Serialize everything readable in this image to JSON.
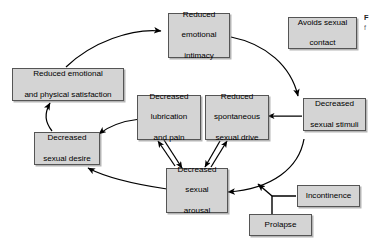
{
  "figure": {
    "type": "cyclical-flow-diagram",
    "title": "",
    "background_color": "#ffffff",
    "node_fill_color": "#d4d4d4",
    "node_border_color": "#555555",
    "arrow_color": "#000000"
  },
  "nodes": [
    {
      "id": "reduced-emotional-intimacy",
      "label": "Reduced emotional intimacy",
      "lines": [
        "Reduced",
        "emotional",
        "intimacy"
      ]
    },
    {
      "id": "avoids-sexual-contact",
      "label": "Avoids sexual contact",
      "lines": [
        "Avoids sexual",
        "contact"
      ]
    },
    {
      "id": "reduced-emotional-and-physical-satisfaction",
      "label": "Reduced emotional and physical satisfaction",
      "lines": [
        "Reduced emotional",
        "and physical satisfaction"
      ]
    },
    {
      "id": "decreased-sexual-stimuli",
      "label": "Decreased sexual stimuli",
      "lines": [
        "Decreased",
        "sexual stimuli"
      ]
    },
    {
      "id": "decreased-lubrication-and-pain",
      "label": "Decreased lubrication and pain",
      "lines": [
        "Decreased",
        "lubrication",
        "and pain"
      ]
    },
    {
      "id": "reduced-spontaneous-sexual-drive",
      "label": "Reduced spontaneous sexual drive",
      "lines": [
        "Reduced",
        "spontaneous",
        "sexual drive"
      ]
    },
    {
      "id": "decreased-sexual-desire",
      "label": "Decreased sexual desire",
      "lines": [
        "Decreased",
        "sexual desire"
      ]
    },
    {
      "id": "decreased-sexual-arousal",
      "label": "Decreased sexual arousal",
      "lines": [
        "Decreased",
        "sexual",
        "arousal"
      ]
    },
    {
      "id": "incontinence",
      "label": "Incontinence",
      "lines": [
        "Incontinence"
      ]
    },
    {
      "id": "prolapse",
      "label": "Prolapse",
      "lines": [
        "Prolapse"
      ]
    }
  ],
  "edges": [
    {
      "from": "reduced-emotional-and-physical-satisfaction",
      "to": "reduced-emotional-intimacy",
      "style": "curved-arrow"
    },
    {
      "from": "reduced-emotional-intimacy",
      "to": "decreased-sexual-stimuli",
      "style": "curved-arrow"
    },
    {
      "from": "decreased-sexual-stimuli",
      "to": "reduced-spontaneous-sexual-drive",
      "style": "straight-arrow"
    },
    {
      "from": "decreased-sexual-stimuli",
      "to": "decreased-sexual-arousal",
      "style": "curved-arrow"
    },
    {
      "from": "decreased-sexual-arousal",
      "to": "decreased-sexual-desire",
      "style": "curved-arrow"
    },
    {
      "from": "decreased-sexual-desire",
      "to": "reduced-emotional-and-physical-satisfaction",
      "style": "curved-arrow"
    },
    {
      "from": "decreased-sexual-arousal",
      "to": "decreased-lubrication-and-pain",
      "style": "straight-arrow"
    },
    {
      "from": "decreased-sexual-arousal",
      "to": "reduced-spontaneous-sexual-drive",
      "style": "straight-arrow"
    },
    {
      "from": "decreased-lubrication-and-pain",
      "to": "decreased-sexual-arousal",
      "style": "straight-arrow"
    },
    {
      "from": "decreased-lubrication-and-pain",
      "to": "decreased-sexual-desire",
      "style": "curved-arrow"
    },
    {
      "from": "incontinence",
      "to": "decreased-sexual-arousal",
      "style": "elbow-arrow"
    },
    {
      "from": "prolapse",
      "to": "decreased-sexual-arousal",
      "style": "elbow-arrow"
    }
  ],
  "caption": {
    "line1": "F",
    "line2": "f"
  }
}
